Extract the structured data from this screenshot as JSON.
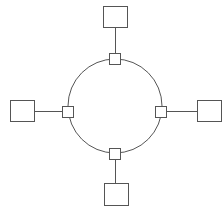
{
  "diagram": {
    "type": "ring-topology",
    "colors": {
      "stroke": "#555555",
      "fill": "#ffffff",
      "background": "#ffffff"
    },
    "ring": {
      "cx": 115,
      "cy": 106,
      "r": 47
    },
    "connectors": [
      {
        "id": "top",
        "x": 109,
        "y": 53,
        "w": 11,
        "h": 11
      },
      {
        "id": "left",
        "x": 62,
        "y": 106,
        "w": 11,
        "h": 11
      },
      {
        "id": "right",
        "x": 155,
        "y": 106,
        "w": 11,
        "h": 11
      },
      {
        "id": "bottom",
        "x": 109,
        "y": 148,
        "w": 11,
        "h": 11
      }
    ],
    "nodes": [
      {
        "id": "top",
        "x": 103,
        "y": 6,
        "w": 24,
        "h": 21
      },
      {
        "id": "left",
        "x": 10,
        "y": 100,
        "w": 24,
        "h": 21
      },
      {
        "id": "right",
        "x": 197,
        "y": 100,
        "w": 24,
        "h": 21
      },
      {
        "id": "bottom",
        "x": 104,
        "y": 183,
        "w": 24,
        "h": 22
      }
    ],
    "links": [
      {
        "id": "top",
        "x1": 115,
        "y1": 27,
        "x2": 115,
        "y2": 53
      },
      {
        "id": "left",
        "x1": 34,
        "y1": 111,
        "x2": 62,
        "y2": 111
      },
      {
        "id": "right",
        "x1": 166,
        "y1": 111,
        "x2": 197,
        "y2": 111
      },
      {
        "id": "bottom",
        "x1": 115,
        "y1": 159,
        "x2": 115,
        "y2": 183
      }
    ]
  }
}
